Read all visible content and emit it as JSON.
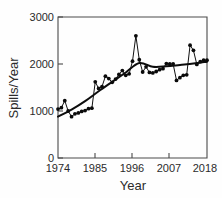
{
  "chart_data": {
    "type": "line",
    "title": "",
    "xlabel": "Year",
    "ylabel": "Spills/Year",
    "xlim": [
      1974,
      2018
    ],
    "ylim": [
      0,
      3000
    ],
    "xticks": [
      1974,
      1985,
      1996,
      2007,
      2018
    ],
    "xtick_labels": [
      "1974",
      "1985",
      "1996",
      "2007",
      "2018"
    ],
    "yticks": [
      0,
      1000,
      2000,
      3000
    ],
    "ytick_labels": [
      "0",
      "1000",
      "2000",
      "3000"
    ],
    "grid": false,
    "legend": "none",
    "marker": "filled-circle",
    "series": [
      {
        "name": "Spills per year",
        "style": "line-with-markers",
        "x": [
          1974,
          1975,
          1976,
          1977,
          1978,
          1979,
          1980,
          1981,
          1982,
          1983,
          1984,
          1985,
          1986,
          1987,
          1988,
          1989,
          1990,
          1991,
          1992,
          1993,
          1994,
          1995,
          1996,
          1997,
          1998,
          1999,
          2000,
          2001,
          2002,
          2003,
          2004,
          2005,
          2006,
          2007,
          2008,
          2009,
          2010,
          2011,
          2012,
          2013,
          2014,
          2015,
          2016,
          2017,
          2018
        ],
        "values": [
          1040,
          1070,
          1220,
          1000,
          880,
          940,
          960,
          990,
          1010,
          1050,
          1060,
          1620,
          1480,
          1520,
          1740,
          1690,
          1610,
          1680,
          1780,
          1860,
          1760,
          1790,
          2060,
          2600,
          2090,
          1830,
          1940,
          1820,
          1810,
          1840,
          1880,
          1900,
          2010,
          2000,
          2000,
          1650,
          1710,
          1760,
          1770,
          2400,
          2290,
          1990,
          2050,
          2080,
          2080
        ]
      },
      {
        "name": "Fitted trend",
        "style": "smooth-line-no-markers",
        "x": [
          1974,
          1978,
          1982,
          1986,
          1990,
          1994,
          1998,
          2002,
          2006,
          2010,
          2014,
          2018
        ],
        "values": [
          880,
          1030,
          1210,
          1420,
          1620,
          1820,
          2020,
          1940,
          1950,
          1980,
          2010,
          2050
        ]
      }
    ],
    "annotations": []
  }
}
